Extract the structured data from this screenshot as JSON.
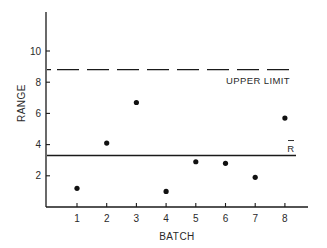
{
  "chart_data": {
    "type": "scatter",
    "title": "",
    "xlabel": "BATCH",
    "ylabel": "RANGE",
    "x": [
      1,
      2,
      3,
      4,
      5,
      6,
      7,
      8
    ],
    "values": [
      1.2,
      4.1,
      6.7,
      1.0,
      2.9,
      2.8,
      1.9,
      5.7
    ],
    "xticks": [
      "1",
      "2",
      "3",
      "4",
      "5",
      "6",
      "7",
      "8"
    ],
    "yticks": [
      "2",
      "4",
      "6",
      "8",
      "10"
    ],
    "xlim": [
      0,
      8.8
    ],
    "ylim": [
      0,
      12.5
    ],
    "grid": false,
    "legend": null,
    "reference_lines": [
      {
        "name": "UPPER LIMIT",
        "y": 8.8,
        "style": "dashed"
      },
      {
        "name": "R̄",
        "y": 3.3,
        "style": "solid"
      }
    ],
    "annotations": [
      {
        "text": "UPPER LIMIT",
        "near": "upper-limit-line",
        "position": "below-right"
      },
      {
        "text": "R̄",
        "near": "r-bar-line",
        "position": "above-right"
      }
    ]
  },
  "labels": {
    "xlabel": "BATCH",
    "ylabel": "RANGE",
    "upper_limit": "UPPER LIMIT",
    "r_bar": "R"
  },
  "ticks": {
    "x": [
      "1",
      "2",
      "3",
      "4",
      "5",
      "6",
      "7",
      "8"
    ],
    "y": [
      "2",
      "4",
      "6",
      "8",
      "10"
    ]
  },
  "colors": {
    "ink": "#1a1a1a",
    "background": "#ffffff"
  }
}
